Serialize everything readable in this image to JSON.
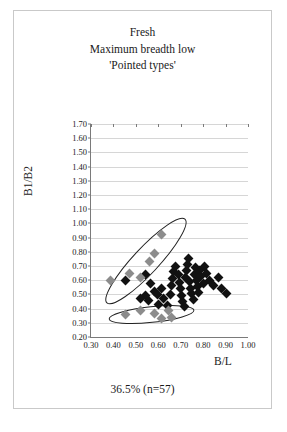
{
  "title": {
    "line1": "Fresh",
    "line2": "Maximum breadth low",
    "line3": "'Pointed types'"
  },
  "caption": "36.5% (n=57)",
  "axis": {
    "x_title": "B/L",
    "y_title": "B1/B2"
  },
  "chart_data": {
    "type": "scatter",
    "subtitle": "36.5% (n=57)",
    "xlabel": "B/L",
    "ylabel": "B1/B2",
    "xlim": [
      0.3,
      1.0
    ],
    "ylim": [
      0.2,
      1.7
    ],
    "xticks": [
      "0.30",
      "0.40",
      "0.50",
      "0.60",
      "0.70",
      "0.80",
      "0.90",
      "1.00"
    ],
    "yticks": [
      "0.20",
      "0.30",
      "0.40",
      "0.50",
      "0.60",
      "0.70",
      "0.80",
      "0.90",
      "1.00",
      "1.10",
      "1.20",
      "1.30",
      "1.40",
      "1.50",
      "1.60",
      "1.70"
    ],
    "grid": "horizontal",
    "legend": "none",
    "n": 57,
    "series": [
      {
        "name": "main-cluster",
        "marker": "diamond",
        "color": "#111111",
        "points": [
          [
            0.455,
            0.6
          ],
          [
            0.545,
            0.64
          ],
          [
            0.565,
            0.58
          ],
          [
            0.585,
            0.52
          ],
          [
            0.545,
            0.495
          ],
          [
            0.52,
            0.47
          ],
          [
            0.555,
            0.455
          ],
          [
            0.595,
            0.5
          ],
          [
            0.615,
            0.545
          ],
          [
            0.625,
            0.47
          ],
          [
            0.6,
            0.43
          ],
          [
            0.64,
            0.42
          ],
          [
            0.655,
            0.5
          ],
          [
            0.66,
            0.56
          ],
          [
            0.665,
            0.615
          ],
          [
            0.67,
            0.66
          ],
          [
            0.675,
            0.7
          ],
          [
            0.69,
            0.64
          ],
          [
            0.695,
            0.585
          ],
          [
            0.7,
            0.54
          ],
          [
            0.705,
            0.495
          ],
          [
            0.71,
            0.45
          ],
          [
            0.715,
            0.415
          ],
          [
            0.72,
            0.62
          ],
          [
            0.725,
            0.665
          ],
          [
            0.73,
            0.71
          ],
          [
            0.735,
            0.75
          ],
          [
            0.74,
            0.59
          ],
          [
            0.745,
            0.545
          ],
          [
            0.75,
            0.505
          ],
          [
            0.755,
            0.465
          ],
          [
            0.76,
            0.64
          ],
          [
            0.765,
            0.69
          ],
          [
            0.77,
            0.6
          ],
          [
            0.775,
            0.555
          ],
          [
            0.78,
            0.515
          ],
          [
            0.785,
            0.67
          ],
          [
            0.79,
            0.625
          ],
          [
            0.8,
            0.58
          ],
          [
            0.805,
            0.7
          ],
          [
            0.815,
            0.645
          ],
          [
            0.83,
            0.6
          ],
          [
            0.845,
            0.56
          ],
          [
            0.87,
            0.62
          ],
          [
            0.88,
            0.545
          ],
          [
            0.905,
            0.505
          ]
        ]
      },
      {
        "name": "upper-group",
        "marker": "diamond",
        "color": "#8c8c8c",
        "points": [
          [
            0.385,
            0.6
          ],
          [
            0.47,
            0.645
          ],
          [
            0.52,
            0.62
          ],
          [
            0.56,
            0.73
          ],
          [
            0.585,
            0.79
          ],
          [
            0.615,
            0.92
          ]
        ]
      },
      {
        "name": "lower-group",
        "marker": "diamond",
        "color": "#8c8c8c",
        "points": [
          [
            0.455,
            0.355
          ],
          [
            0.52,
            0.39
          ],
          [
            0.585,
            0.365
          ],
          [
            0.615,
            0.33
          ],
          [
            0.645,
            0.385
          ],
          [
            0.66,
            0.34
          ]
        ]
      }
    ],
    "annotations": [
      {
        "name": "upper-ellipse",
        "shape": "ellipse",
        "center": [
          0.545,
          0.735
        ],
        "rx": 0.255,
        "ry": 0.09,
        "rotation_deg": -47
      },
      {
        "name": "lower-ellipse",
        "shape": "ellipse",
        "center": [
          0.57,
          0.358
        ],
        "rx": 0.19,
        "ry": 0.055,
        "rotation_deg": -6
      }
    ]
  }
}
